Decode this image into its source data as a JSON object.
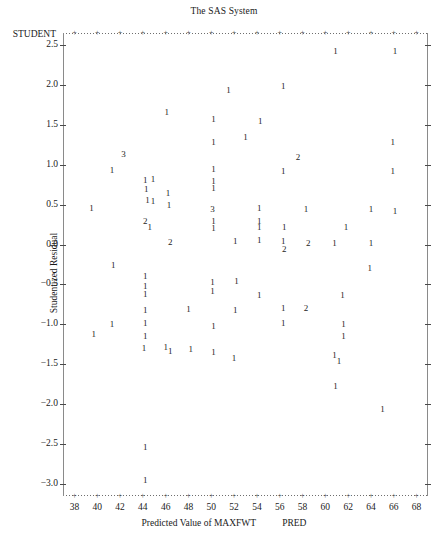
{
  "header": {
    "title": "The SAS System"
  },
  "plot": {
    "corner_label": "STUDENT",
    "y_axis_title": "Studentized Residual",
    "x_axis_title": "Predicted Value of MAXFWT",
    "x_axis_variable": "PRED",
    "y_ticks": [
      "2.5",
      "2.0",
      "1.5",
      "1.0",
      "0.5",
      "0.0",
      "-0.5",
      "-1.0",
      "-1.5",
      "-2.0",
      "-2.5",
      "-3.0"
    ],
    "x_ticks": [
      "38",
      "40",
      "42",
      "44",
      "46",
      "48",
      "50",
      "52",
      "54",
      "56",
      "58",
      "60",
      "62",
      "64",
      "66",
      "68"
    ],
    "frame_color": "#6e6e6e",
    "point_color": "#232323"
  },
  "chart_data": {
    "type": "scatter",
    "title": "The SAS System",
    "xlabel": "Predicted Value of MAXFWT   PRED",
    "ylabel": "Studentized Residual",
    "xlim": [
      37,
      69
    ],
    "ylim": [
      -3.15,
      2.65
    ],
    "grid": false,
    "legend": null,
    "note": "SAS PROC plot character scatter; each plotted glyph is the count of observations at that position (1, 2, 3 = overplotted points).",
    "points": [
      {
        "x": 60.9,
        "y": 2.42,
        "label": "1"
      },
      {
        "x": 66.1,
        "y": 2.42,
        "label": "1"
      },
      {
        "x": 56.3,
        "y": 1.99,
        "label": "1"
      },
      {
        "x": 51.5,
        "y": 1.94,
        "label": "1"
      },
      {
        "x": 46.1,
        "y": 1.66,
        "label": "1"
      },
      {
        "x": 50.2,
        "y": 1.57,
        "label": "1"
      },
      {
        "x": 54.3,
        "y": 1.55,
        "label": "1"
      },
      {
        "x": 53.0,
        "y": 1.35,
        "label": "1"
      },
      {
        "x": 50.2,
        "y": 1.29,
        "label": "1"
      },
      {
        "x": 65.9,
        "y": 1.28,
        "label": "1"
      },
      {
        "x": 42.3,
        "y": 1.13,
        "label": "3"
      },
      {
        "x": 57.6,
        "y": 1.1,
        "label": "2"
      },
      {
        "x": 41.3,
        "y": 0.93,
        "label": "1"
      },
      {
        "x": 50.2,
        "y": 0.95,
        "label": "1"
      },
      {
        "x": 56.3,
        "y": 0.92,
        "label": "1"
      },
      {
        "x": 65.9,
        "y": 0.92,
        "label": "1"
      },
      {
        "x": 44.2,
        "y": 0.81,
        "label": "1"
      },
      {
        "x": 44.9,
        "y": 0.82,
        "label": "1"
      },
      {
        "x": 50.2,
        "y": 0.8,
        "label": "1"
      },
      {
        "x": 44.3,
        "y": 0.7,
        "label": "1"
      },
      {
        "x": 50.2,
        "y": 0.71,
        "label": "1"
      },
      {
        "x": 46.2,
        "y": 0.64,
        "label": "1"
      },
      {
        "x": 44.4,
        "y": 0.56,
        "label": "1"
      },
      {
        "x": 44.9,
        "y": 0.55,
        "label": "1"
      },
      {
        "x": 46.3,
        "y": 0.5,
        "label": "1"
      },
      {
        "x": 39.5,
        "y": 0.46,
        "label": "1"
      },
      {
        "x": 50.1,
        "y": 0.45,
        "label": "3"
      },
      {
        "x": 54.2,
        "y": 0.46,
        "label": "1"
      },
      {
        "x": 58.3,
        "y": 0.45,
        "label": "1"
      },
      {
        "x": 64.0,
        "y": 0.45,
        "label": "1"
      },
      {
        "x": 66.1,
        "y": 0.42,
        "label": "1"
      },
      {
        "x": 44.2,
        "y": 0.29,
        "label": "2"
      },
      {
        "x": 50.2,
        "y": 0.3,
        "label": "1"
      },
      {
        "x": 54.2,
        "y": 0.3,
        "label": "1"
      },
      {
        "x": 44.6,
        "y": 0.22,
        "label": "1"
      },
      {
        "x": 50.2,
        "y": 0.21,
        "label": "1"
      },
      {
        "x": 54.2,
        "y": 0.22,
        "label": "1"
      },
      {
        "x": 56.4,
        "y": 0.22,
        "label": "1"
      },
      {
        "x": 61.8,
        "y": 0.22,
        "label": "1"
      },
      {
        "x": 46.4,
        "y": 0.03,
        "label": "2"
      },
      {
        "x": 52.1,
        "y": 0.04,
        "label": "1"
      },
      {
        "x": 54.2,
        "y": 0.06,
        "label": "1"
      },
      {
        "x": 56.3,
        "y": 0.05,
        "label": "1"
      },
      {
        "x": 58.5,
        "y": 0.02,
        "label": "2"
      },
      {
        "x": 60.8,
        "y": 0.02,
        "label": "1"
      },
      {
        "x": 64.0,
        "y": 0.02,
        "label": "1"
      },
      {
        "x": 56.4,
        "y": -0.06,
        "label": "2"
      },
      {
        "x": 41.4,
        "y": -0.25,
        "label": "1"
      },
      {
        "x": 63.9,
        "y": -0.3,
        "label": "1"
      },
      {
        "x": 44.2,
        "y": -0.4,
        "label": "1"
      },
      {
        "x": 44.2,
        "y": -0.52,
        "label": "1"
      },
      {
        "x": 50.1,
        "y": -0.47,
        "label": "1"
      },
      {
        "x": 52.2,
        "y": -0.46,
        "label": "1"
      },
      {
        "x": 50.1,
        "y": -0.58,
        "label": "1"
      },
      {
        "x": 44.2,
        "y": -0.62,
        "label": "1"
      },
      {
        "x": 54.2,
        "y": -0.63,
        "label": "1"
      },
      {
        "x": 61.5,
        "y": -0.63,
        "label": "1"
      },
      {
        "x": 44.2,
        "y": -0.82,
        "label": "1"
      },
      {
        "x": 48.0,
        "y": -0.81,
        "label": "1"
      },
      {
        "x": 52.1,
        "y": -0.82,
        "label": "1"
      },
      {
        "x": 56.3,
        "y": -0.8,
        "label": "1"
      },
      {
        "x": 58.3,
        "y": -0.8,
        "label": "2"
      },
      {
        "x": 41.3,
        "y": -1.0,
        "label": "1"
      },
      {
        "x": 44.2,
        "y": -0.98,
        "label": "1"
      },
      {
        "x": 50.2,
        "y": -1.02,
        "label": "1"
      },
      {
        "x": 56.3,
        "y": -0.98,
        "label": "1"
      },
      {
        "x": 61.6,
        "y": -1.0,
        "label": "1"
      },
      {
        "x": 44.2,
        "y": -1.14,
        "label": "1"
      },
      {
        "x": 61.6,
        "y": -1.14,
        "label": "1"
      },
      {
        "x": 39.7,
        "y": -1.12,
        "label": "1"
      },
      {
        "x": 44.1,
        "y": -1.3,
        "label": "1"
      },
      {
        "x": 46.0,
        "y": -1.28,
        "label": "1"
      },
      {
        "x": 46.4,
        "y": -1.33,
        "label": "1"
      },
      {
        "x": 48.2,
        "y": -1.31,
        "label": "1"
      },
      {
        "x": 50.2,
        "y": -1.35,
        "label": "1"
      },
      {
        "x": 52.0,
        "y": -1.42,
        "label": "1"
      },
      {
        "x": 60.8,
        "y": -1.38,
        "label": "1"
      },
      {
        "x": 61.2,
        "y": -1.46,
        "label": "1"
      },
      {
        "x": 60.9,
        "y": -1.77,
        "label": "1"
      },
      {
        "x": 65.0,
        "y": -2.06,
        "label": "1"
      },
      {
        "x": 44.2,
        "y": -2.53,
        "label": "1"
      },
      {
        "x": 44.2,
        "y": -2.95,
        "label": "1"
      }
    ]
  }
}
